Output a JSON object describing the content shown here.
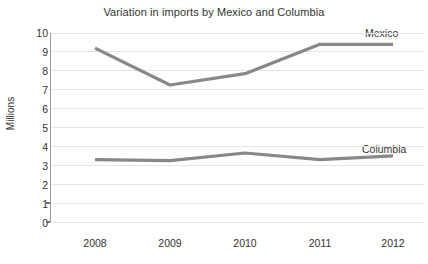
{
  "chart_data": {
    "type": "line",
    "title": "Variation in imports by Mexico and Columbia",
    "xlabel": "",
    "ylabel": "Millions",
    "categories": [
      "2008",
      "2009",
      "2010",
      "2011",
      "2012"
    ],
    "x": [
      2008,
      2009,
      2010,
      2011,
      2012
    ],
    "series": [
      {
        "name": "Mexico",
        "values": [
          9.2,
          7.25,
          7.85,
          9.4,
          9.4
        ],
        "color": "#888888"
      },
      {
        "name": "Columbia",
        "values": [
          3.3,
          3.25,
          3.65,
          3.3,
          3.5
        ],
        "color": "#888888"
      }
    ],
    "ylim": [
      0,
      10
    ],
    "ytick_labels": [
      "10",
      "9",
      "8",
      "7",
      "6",
      "5",
      "4",
      "3",
      "2",
      "1",
      "0"
    ],
    "ytick_values": [
      10,
      9,
      8,
      7,
      6,
      5,
      4,
      3,
      2,
      1,
      0
    ],
    "grid": true,
    "grid_color": "#e4e4e4",
    "legend": "inline-labels",
    "legend_position": "right-of-series",
    "background_color": "#ffffff",
    "axis_color": "#9a9a9a",
    "text_color": "#333333"
  }
}
